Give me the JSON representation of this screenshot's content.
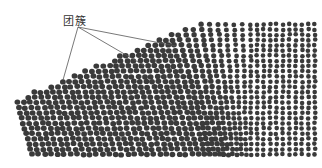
{
  "figure": {
    "label": "团簇",
    "annotation_targets": [
      {
        "x": 63,
        "y": 80
      },
      {
        "x": 145,
        "y": 66
      },
      {
        "x": 176,
        "y": 46
      }
    ],
    "label_anchor": {
      "x": 78,
      "y": 27
    },
    "atom_color": "#3a3a3a",
    "line_color": "#555555",
    "background": "#ffffff"
  }
}
